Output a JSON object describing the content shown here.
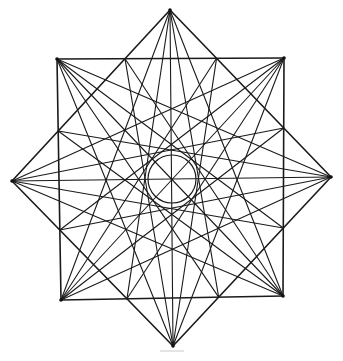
{
  "figure": {
    "vertices": [
      {
        "id": "top",
        "label": ""
      },
      {
        "id": "top-right-corner",
        "label": ""
      },
      {
        "id": "right",
        "label": ""
      },
      {
        "id": "bottom-right-corner",
        "label": ""
      },
      {
        "id": "bottom",
        "label": ""
      },
      {
        "id": "bottom-left-corner",
        "label": ""
      },
      {
        "id": "left",
        "label": ""
      },
      {
        "id": "top-left-corner",
        "label": ""
      }
    ],
    "chord_steps": [
      2,
      3,
      4
    ],
    "extra_lines": "each point to the two square/diamond crossing points on the opposite side",
    "center_circle": true,
    "line_color": "#1a1a1a",
    "background_color": "#ffffff"
  }
}
